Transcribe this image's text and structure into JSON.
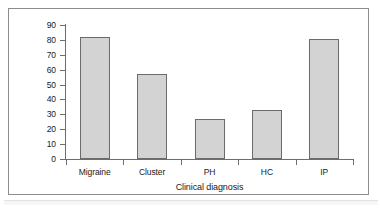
{
  "figure": {
    "background_color": "#ffffff",
    "frame_color": "#8c8c8c"
  },
  "chart_data": {
    "type": "bar",
    "title": "",
    "subtitle": "",
    "categories": [
      "Migraine",
      "Cluster",
      "PH",
      "HC",
      "IP"
    ],
    "values": [
      82,
      57,
      27,
      33,
      80.5
    ],
    "series": [
      {
        "name": "Percent with throbbing pain",
        "values": [
          82,
          57,
          27,
          33,
          80.5
        ]
      }
    ],
    "xlabel": "Clinical diagnosis",
    "ylabel": "Percent with throbbing pain",
    "ylim": [
      0,
      90
    ],
    "ytick_step": 10,
    "yticks": [
      90,
      80,
      70,
      60,
      50,
      40,
      30,
      20,
      10,
      0
    ],
    "ytick_labels": [
      "90",
      "80",
      "70",
      "60",
      "50",
      "40",
      "30",
      "20",
      "10",
      "0"
    ],
    "grid": false,
    "legend": false,
    "legend_position": "none",
    "bar_fill_color": "#d3d3d3",
    "bar_edge_color": "#6b6b6b",
    "axis_color": "#6e6e6e",
    "text_color": "#1a1a1a"
  }
}
